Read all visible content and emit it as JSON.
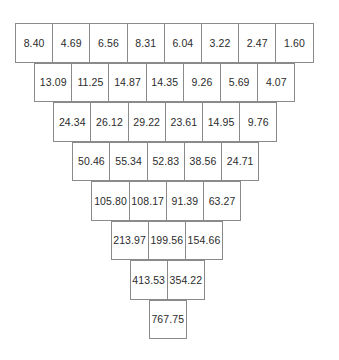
{
  "diagram": {
    "type": "inverted-number-pyramid",
    "colors": {
      "background": "#ffffff",
      "cell_fill": "#ffffff",
      "cell_border": "#8a8a8a",
      "text": "#2b2b2b"
    },
    "geometry": {
      "cell_width": 38.2,
      "cell_height": 39.5,
      "row_step_y": 39.5,
      "row_indent_x": 19.1,
      "origin_x": 15,
      "origin_y": 23
    },
    "rows": [
      {
        "index": 0,
        "left": 15,
        "top": 23,
        "cells": [
          "8.40",
          "4.69",
          "6.56",
          "8.31",
          "6.04",
          "3.22",
          "2.47",
          "1.60"
        ]
      },
      {
        "index": 1,
        "left": 34.1,
        "top": 62.5,
        "cells": [
          "13.09",
          "11.25",
          "14.87",
          "14.35",
          "9.26",
          "5.69",
          "4.07"
        ]
      },
      {
        "index": 2,
        "left": 53.2,
        "top": 102,
        "cells": [
          "24.34",
          "26.12",
          "29.22",
          "23.61",
          "14.95",
          "9.76"
        ]
      },
      {
        "index": 3,
        "left": 72.3,
        "top": 141.5,
        "cells": [
          "50.46",
          "55.34",
          "52.83",
          "38.56",
          "24.71"
        ]
      },
      {
        "index": 4,
        "left": 91.4,
        "top": 181,
        "cells": [
          "105.80",
          "108.17",
          "91.39",
          "63.27"
        ]
      },
      {
        "index": 5,
        "left": 110.5,
        "top": 220.5,
        "cells": [
          "213.97",
          "199.56",
          "154.66"
        ]
      },
      {
        "index": 6,
        "left": 129.6,
        "top": 260,
        "cells": [
          "413.53",
          "354.22"
        ]
      },
      {
        "index": 7,
        "left": 148.7,
        "top": 299.5,
        "cells": [
          "767.75"
        ]
      }
    ]
  }
}
